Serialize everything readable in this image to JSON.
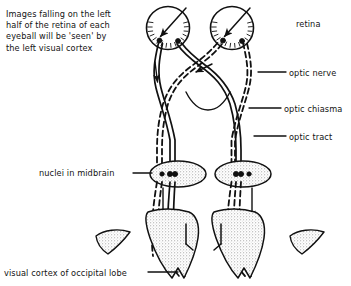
{
  "figure": {
    "type": "anatomical-diagram",
    "background_color": "#ffffff",
    "ink_color": "#111111",
    "stipple_color": "#9a9a9a"
  },
  "callout": {
    "text": "Images falling on the left\nhalf of the retina of each\neyeball will be 'seen' by\nthe left visual cortex"
  },
  "labels": {
    "retina": "retina",
    "optic_nerve": "optic nerve",
    "optic_chiasma": "optic chiasma",
    "optic_tract": "optic tract",
    "nuclei_midbrain": "nuclei in midbrain",
    "visual_cortex": "visual cortex of occipital lobe"
  },
  "structures": {
    "eyeballs": 2,
    "nuclei": 2,
    "occipital_lobes": 2,
    "pathway_left_style": "solid",
    "pathway_right_style": "dashed"
  }
}
